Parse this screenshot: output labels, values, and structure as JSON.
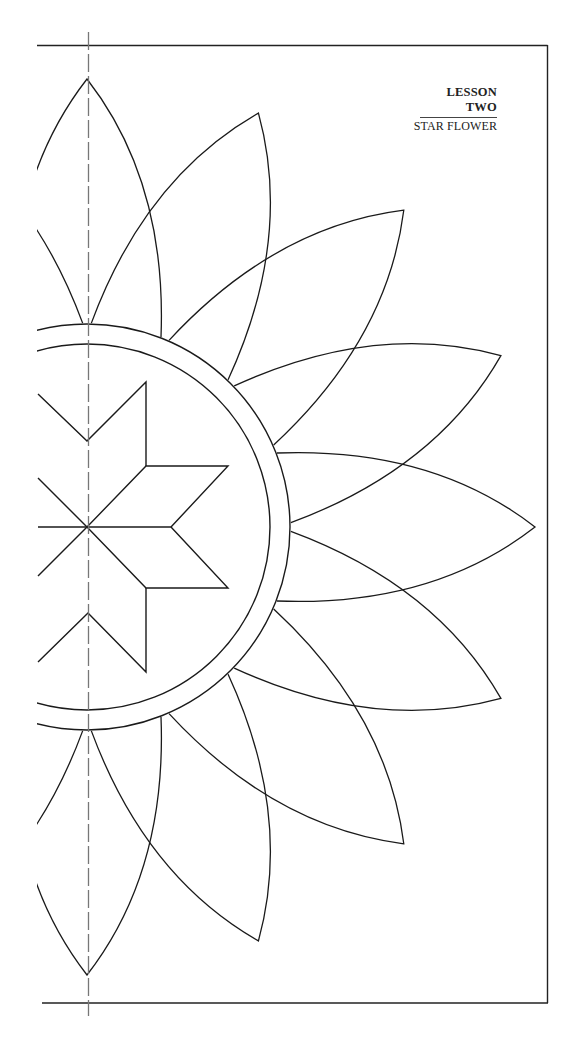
{
  "header": {
    "lesson": "LESSON TWO",
    "title": "STAR FLOWER"
  },
  "diagram": {
    "type": "quilting-template",
    "stroke_color": "#1a1a1a",
    "fold_line_color": "#777777",
    "center": [
      87,
      527
    ],
    "inner_circle_radius": 183,
    "outer_circle_radius": 203,
    "petal_count_full": 16,
    "petal_angles_visible": [
      112.5,
      90,
      67.5,
      45,
      22.5,
      0,
      -22.5,
      -45,
      -67.5,
      -90,
      -112.5
    ],
    "petal_tip_radius": 448,
    "star_points": 8,
    "fold_line": "dashed vertical centerline"
  },
  "icons": {
    "fold-line": "dashed-line",
    "border": "frame"
  }
}
